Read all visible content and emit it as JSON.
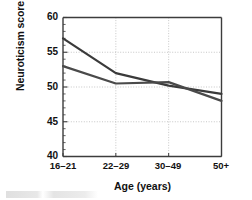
{
  "chart_data": {
    "type": "line",
    "title": "",
    "xlabel": "Age (years)",
    "ylabel": "Neuroticism score",
    "categories": [
      "16–21",
      "22–29",
      "30–49",
      "50+"
    ],
    "series": [
      {
        "name": "series-1",
        "values": [
          57.0,
          52.0,
          50.2,
          49.0
        ],
        "color": "#3a3a3a"
      },
      {
        "name": "series-2",
        "values": [
          53.0,
          50.5,
          50.7,
          48.0
        ],
        "color": "#4a4a4a"
      }
    ],
    "ylim": [
      40,
      60
    ],
    "yticks": [
      60,
      55,
      50,
      45,
      40
    ],
    "ytick_labels": [
      "60",
      "55",
      "50",
      "45",
      "40"
    ],
    "y_minor_step": 1,
    "grid": "dotted gridlines at major y ticks and at each category",
    "legend": "none",
    "axis_color": "#3c3c3c",
    "grid_color": "#b9b9b9",
    "background": "#ffffff"
  },
  "axes": {
    "ytick_labels": [
      "60",
      "55",
      "50",
      "45",
      "40"
    ],
    "xtick_labels": [
      "16–21",
      "22–29",
      "30–49",
      "50+"
    ],
    "xlabel": "Age (years)",
    "ylabel": "Neuroticism score"
  }
}
